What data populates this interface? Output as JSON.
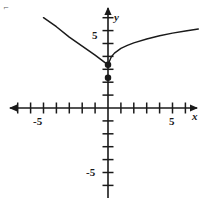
{
  "figure": {
    "background_color": "#ffffff",
    "ink_color": "#1a1a1a",
    "corner_mark": "⌐"
  },
  "axes": {
    "x_axis_label": "x",
    "y_axis_label": "y",
    "x_tick_labels": [
      {
        "text": "-5",
        "value": -5
      },
      {
        "text": "5",
        "value": 5
      }
    ],
    "y_tick_labels": [
      {
        "text": "5",
        "value": 5
      },
      {
        "text": "-5",
        "value": -5
      }
    ]
  },
  "chart_data": {
    "type": "line",
    "title": "",
    "xlabel": "x",
    "ylabel": "y",
    "xlim": [
      -7.5,
      7.1
    ],
    "ylim": [
      -7.5,
      7.1
    ],
    "origin_px": [
      108,
      108
    ],
    "unit_px": 12.9,
    "grid": false,
    "legend": "none",
    "x_ticks": [
      -7,
      -6,
      -5,
      -4,
      -3,
      -2,
      -1,
      1,
      2,
      3,
      4,
      5,
      6,
      7
    ],
    "y_ticks": [
      -7,
      -6,
      -5,
      -4,
      -3,
      -2,
      -1,
      1,
      2,
      3,
      4,
      5,
      6,
      7
    ],
    "x_tick_labeled": [
      -5,
      5
    ],
    "y_tick_labeled": [
      -5,
      5
    ],
    "series": [
      {
        "name": "linear-ray",
        "style": "solid",
        "description": "straight ray descending from upper-left to endpoint on y-axis",
        "points": [
          {
            "x": -5.0,
            "y": 7.0
          },
          {
            "x": -4.0,
            "y": 6.3
          },
          {
            "x": -3.0,
            "y": 5.5
          },
          {
            "x": -2.0,
            "y": 4.8
          },
          {
            "x": -1.0,
            "y": 4.1
          },
          {
            "x": 0.0,
            "y": 3.35
          }
        ]
      },
      {
        "name": "sqrt-curve",
        "style": "solid",
        "description": "square-root shaped curve rising to the right from the y-axis",
        "points": [
          {
            "x": 0.0,
            "y": 3.35
          },
          {
            "x": 0.25,
            "y": 3.95
          },
          {
            "x": 0.5,
            "y": 4.25
          },
          {
            "x": 1.0,
            "y": 4.62
          },
          {
            "x": 1.5,
            "y": 4.85
          },
          {
            "x": 2.0,
            "y": 5.05
          },
          {
            "x": 3.0,
            "y": 5.35
          },
          {
            "x": 4.0,
            "y": 5.6
          },
          {
            "x": 5.0,
            "y": 5.8
          },
          {
            "x": 6.0,
            "y": 5.97
          },
          {
            "x": 7.0,
            "y": 6.12
          }
        ]
      }
    ],
    "marked_points": [
      {
        "name": "upper-endpoint",
        "x": 0,
        "y": 3.35,
        "fill": "closed"
      },
      {
        "name": "lower-endpoint",
        "x": 0,
        "y": 2.35,
        "fill": "closed"
      }
    ]
  }
}
